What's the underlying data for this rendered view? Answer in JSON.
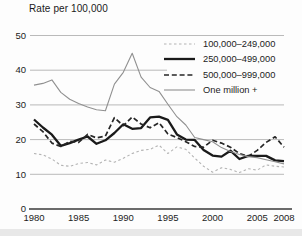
{
  "title": "Rate per 100,000",
  "chart_data": {
    "type": "line",
    "title": "Rate per 100,000",
    "xlabel": "",
    "ylabel": "Rate per 100,000",
    "xlim": [
      1980,
      2008
    ],
    "ylim": [
      0,
      50
    ],
    "grid": "horizontal",
    "legend_position": "top-right",
    "x_ticks": [
      1980,
      1985,
      1990,
      1995,
      2000,
      2005,
      2008
    ],
    "y_ticks": [
      0,
      10,
      20,
      30,
      40,
      50
    ],
    "x": [
      1980,
      1981,
      1982,
      1983,
      1984,
      1985,
      1986,
      1987,
      1988,
      1989,
      1990,
      1991,
      1992,
      1993,
      1994,
      1995,
      1996,
      1997,
      1998,
      1999,
      2000,
      2001,
      2002,
      2003,
      2004,
      2005,
      2006,
      2007,
      2008
    ],
    "series": [
      {
        "name": "100,000–249,000",
        "color": "#b3b3b3",
        "dash": "2.5,2.5",
        "width": 1.1,
        "values": [
          16.0,
          15.6,
          14.4,
          12.6,
          12.3,
          13.1,
          13.4,
          12.7,
          14.1,
          13.5,
          14.6,
          16.0,
          16.9,
          17.2,
          18.4,
          16.0,
          17.9,
          17.2,
          14.7,
          12.3,
          10.6,
          11.9,
          11.4,
          10.5,
          11.6,
          11.2,
          12.7,
          12.3,
          12.1
        ]
      },
      {
        "name": "250,000–499,000",
        "color": "#1a1a1a",
        "dash": "",
        "width": 2.3,
        "values": [
          25.8,
          23.5,
          21.4,
          18.2,
          19.0,
          20.0,
          20.9,
          18.8,
          19.8,
          21.9,
          24.4,
          23.1,
          23.3,
          26.4,
          26.6,
          25.7,
          21.5,
          20.0,
          19.9,
          17.0,
          15.4,
          15.1,
          16.8,
          14.4,
          15.3,
          15.3,
          15.3,
          14.0,
          13.8
        ]
      },
      {
        "name": "500,000–999,000",
        "color": "#262626",
        "dash": "5,2.8",
        "width": 1.7,
        "values": [
          24.5,
          22.3,
          19.0,
          18.0,
          19.5,
          19.2,
          21.5,
          20.5,
          21.0,
          26.3,
          24.0,
          26.5,
          24.5,
          23.4,
          24.9,
          21.6,
          20.6,
          19.4,
          18.0,
          17.8,
          19.8,
          19.0,
          17.8,
          16.0,
          15.2,
          16.9,
          19.2,
          20.8,
          17.8
        ]
      },
      {
        "name": "One million +",
        "color": "#909090",
        "dash": "",
        "width": 1.1,
        "values": [
          35.7,
          36.2,
          37.2,
          33.6,
          31.6,
          30.4,
          29.4,
          28.6,
          28.3,
          36.0,
          39.4,
          44.9,
          38.0,
          35.0,
          33.9,
          30.2,
          26.6,
          24.2,
          20.6,
          20.0,
          19.4,
          17.7,
          16.6,
          15.7,
          15.1,
          14.8,
          14.2,
          13.6,
          13.0
        ]
      }
    ],
    "colors": {
      "gridline": "#a8a8a8",
      "axis": "#3a3a3a",
      "text": "#1c1c1c"
    }
  }
}
